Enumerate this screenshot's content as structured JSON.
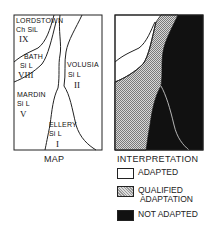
{
  "map": {
    "caption": "MAP",
    "soils": [
      {
        "name": "LORDSTOWN",
        "texture": "Ch SiL",
        "class": "IX"
      },
      {
        "name": "BATH",
        "texture": "Si L",
        "class": "VIII"
      },
      {
        "name": "VOLUSIA",
        "texture": "Si L",
        "class": "II"
      },
      {
        "name": "MARDIN",
        "texture": "Si L",
        "class": "V"
      },
      {
        "name": "ELLERY",
        "texture": "Si L",
        "class": "I"
      }
    ]
  },
  "interpretation": {
    "caption": "INTERPRETATION",
    "legend": [
      {
        "label": "ADAPTED",
        "pattern": "white"
      },
      {
        "label": "QUALIFIED\n ADAPTATION",
        "pattern": "stipple"
      },
      {
        "label": "NOT ADAPTED",
        "pattern": "black"
      }
    ]
  }
}
